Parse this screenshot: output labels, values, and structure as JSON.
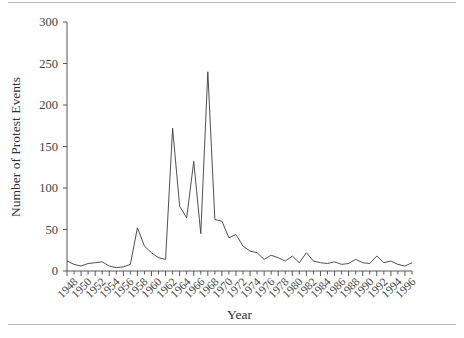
{
  "chart_data": {
    "type": "line",
    "title": "",
    "xlabel": "Year",
    "ylabel": "Number of Protest Events",
    "xlim": [
      1948,
      1997
    ],
    "ylim": [
      0,
      300
    ],
    "yticks": [
      0,
      50,
      100,
      150,
      200,
      250,
      300
    ],
    "xticks": [
      1948,
      1950,
      1952,
      1954,
      1956,
      1958,
      1960,
      1962,
      1964,
      1966,
      1968,
      1970,
      1972,
      1974,
      1976,
      1978,
      1980,
      1982,
      1984,
      1986,
      1988,
      1990,
      1992,
      1994,
      1996
    ],
    "grid": false,
    "legend": null,
    "series": [
      {
        "name": "Protest events",
        "color": "#3c3c3c",
        "x": [
          1948,
          1949,
          1950,
          1951,
          1952,
          1953,
          1954,
          1955,
          1956,
          1957,
          1958,
          1959,
          1960,
          1961,
          1962,
          1963,
          1964,
          1965,
          1966,
          1967,
          1968,
          1969,
          1970,
          1971,
          1972,
          1973,
          1974,
          1975,
          1976,
          1977,
          1978,
          1979,
          1980,
          1981,
          1982,
          1983,
          1984,
          1985,
          1986,
          1987,
          1988,
          1989,
          1990,
          1991,
          1992,
          1993,
          1994,
          1995,
          1996,
          1997
        ],
        "values": [
          12,
          8,
          6,
          9,
          10,
          11,
          6,
          4,
          5,
          8,
          52,
          30,
          22,
          16,
          14,
          172,
          78,
          64,
          132,
          45,
          240,
          62,
          60,
          40,
          44,
          30,
          24,
          22,
          14,
          19,
          16,
          12,
          18,
          10,
          22,
          12,
          10,
          9,
          11,
          8,
          9,
          14,
          10,
          9,
          18,
          10,
          12,
          8,
          6,
          10
        ]
      }
    ]
  },
  "axis_titles": {
    "y": "Number of Protest Events",
    "x": "Year"
  }
}
